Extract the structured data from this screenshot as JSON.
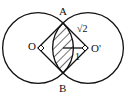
{
  "diagram": {
    "type": "geometry",
    "points": {
      "A": {
        "label": "A",
        "x": 63,
        "y": 23
      },
      "B": {
        "label": "B",
        "x": 63,
        "y": 73
      },
      "O": {
        "label": "O",
        "x": 38,
        "y": 48
      },
      "O_prime": {
        "label": "O'",
        "x": 88,
        "y": 48
      }
    },
    "labels": {
      "A": "A",
      "B": "B",
      "O": "O",
      "O_prime": "O'",
      "side_length": "√2",
      "half_chord": "1"
    },
    "colors": {
      "stroke": "#111111",
      "background": "#ffffff"
    }
  }
}
